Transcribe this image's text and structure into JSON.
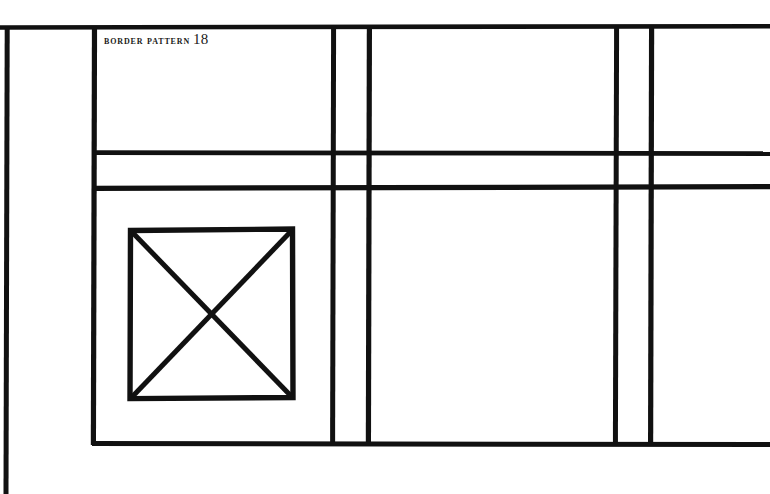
{
  "plate": {
    "caption_words": "Border Pattern",
    "caption_number": "18",
    "background_color": "#ffffff",
    "ink_color": "#111111"
  },
  "drawing": {
    "title": "Border Pattern 18",
    "description": "Hand-drawn rectilinear border pattern diagram composed of heavy black rules forming a grid of bands, with a square containing crossed diagonals in the lower-left panel.",
    "canvas": {
      "width": 770,
      "height": 494
    },
    "stroke_width_px": 5,
    "lines": [
      {
        "name": "outer-left-rule",
        "orientation": "vertical",
        "x": 6,
        "y1": 26,
        "y2": 494
      },
      {
        "name": "inner-left-rule",
        "orientation": "vertical",
        "x": 94,
        "y1": 26,
        "y2": 445
      },
      {
        "name": "mid-left-rule",
        "orientation": "vertical",
        "x": 333,
        "y1": 26,
        "y2": 445
      },
      {
        "name": "mid-right-rule",
        "orientation": "vertical",
        "x": 369,
        "y1": 26,
        "y2": 445
      },
      {
        "name": "outer-right-inner-rule",
        "orientation": "vertical",
        "x": 616,
        "y1": 26,
        "y2": 445
      },
      {
        "name": "outer-right-rule",
        "orientation": "vertical",
        "x": 651,
        "y1": 26,
        "y2": 445
      },
      {
        "name": "top-rule",
        "orientation": "horizontal",
        "y": 27,
        "x1": 0,
        "x2": 770
      },
      {
        "name": "upper-band-rule",
        "orientation": "horizontal",
        "y": 153,
        "x1": 94,
        "x2": 770
      },
      {
        "name": "lower-band-rule",
        "orientation": "horizontal",
        "y": 188,
        "x1": 94,
        "x2": 770
      },
      {
        "name": "bottom-rule",
        "orientation": "horizontal",
        "y": 444,
        "x1": 94,
        "x2": 770
      }
    ],
    "motif": {
      "name": "crossed-square-motif",
      "shape": "square-with-diagonals",
      "x": 129,
      "y": 230,
      "width": 163,
      "height": 168,
      "diagonals": 2
    }
  }
}
